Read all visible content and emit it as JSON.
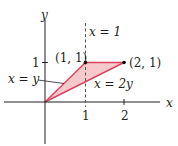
{
  "diagram": {
    "axes": {
      "x_label": "x",
      "y_label": "y",
      "x_ticks": [
        "1",
        "2"
      ],
      "y_ticks": [
        "1"
      ]
    },
    "region": {
      "vertices": [
        [
          0,
          0
        ],
        [
          1,
          1
        ],
        [
          2,
          1
        ]
      ],
      "fill_color": "#f7c9cd",
      "edge_color": "#d8445c"
    },
    "lines": {
      "dashed_label": "x = 1",
      "line1_label": "x = y",
      "line2_label": "x = 2y"
    },
    "points": [
      {
        "label": "(1, 1)"
      },
      {
        "label": "(2, 1)"
      }
    ]
  }
}
